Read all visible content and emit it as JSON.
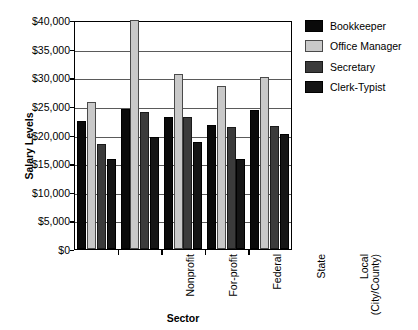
{
  "chart_data": {
    "type": "bar",
    "title": "",
    "xlabel": "Sector",
    "ylabel": "Salary Levels",
    "ylim": [
      0,
      40000
    ],
    "ytick_step": 5000,
    "ytick_labels": [
      "$40,000",
      "$35,000",
      "$30,000",
      "$25,000",
      "$20,000",
      "$15,000",
      "$10,000",
      "$5,000",
      "$0"
    ],
    "ytick_values": [
      40000,
      35000,
      30000,
      25000,
      20000,
      15000,
      10000,
      5000,
      0
    ],
    "grid": true,
    "legend_position": "right",
    "categories": [
      "Nonprofit",
      "For-profit",
      "Federal",
      "State",
      "Local\n(City/County)"
    ],
    "category_labels": [
      "Nonprofit",
      "For-profit",
      "Federal",
      "State",
      "Local (City/County)"
    ],
    "series": [
      {
        "name": "Bookkeeper",
        "color": "#0a0a0a",
        "values": [
          22300,
          24500,
          23000,
          21600,
          24300
        ]
      },
      {
        "name": "Office Manager",
        "color": "#c9c9c9",
        "values": [
          25700,
          40000,
          30500,
          28500,
          30000
        ]
      },
      {
        "name": "Secretary",
        "color": "#3b3b3b",
        "values": [
          18400,
          23900,
          23000,
          21300,
          21500
        ]
      },
      {
        "name": "Clerk-Typist",
        "color": "#151515",
        "values": [
          15800,
          19600,
          18700,
          15800,
          20100
        ]
      }
    ]
  },
  "legend": {
    "items": [
      {
        "label": "Bookkeeper",
        "swatch": "bookkeeper"
      },
      {
        "label": "Office Manager",
        "swatch": "office"
      },
      {
        "label": "Secretary",
        "swatch": "secretary"
      },
      {
        "label": "Clerk-Typist",
        "swatch": "clerk"
      }
    ]
  }
}
